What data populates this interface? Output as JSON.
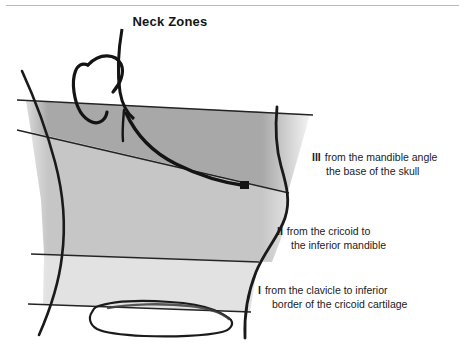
{
  "figure": {
    "title": "Neck Zones",
    "width": 465,
    "height": 357,
    "background": "#ffffff",
    "top_rule_color": "#b9b9b9"
  },
  "zones": [
    {
      "id": "zone-3",
      "numeral": "III",
      "line1": "from the mandible angle",
      "line2": "the base of the skull",
      "fill": "#a8a8a8",
      "description": "Superior zone between the angle of the mandible and the base of the skull"
    },
    {
      "id": "zone-2",
      "numeral": "II",
      "line1": "from the cricoid to",
      "line2": "the inferior mandible",
      "fill": "#c6c6c6",
      "description": "Middle zone between the cricoid cartilage and the inferior border of the mandible"
    },
    {
      "id": "zone-1",
      "numeral": "I",
      "line1": "from the clavicle to inferior",
      "line2": "border of the cricoid cartilage",
      "fill": "#e2e2e2",
      "description": "Inferior zone between the clavicle and the inferior border of the cricoid cartilage"
    }
  ],
  "anatomy": {
    "stroke_color": "#1a1a1a",
    "divider_color": "#232323",
    "parts": [
      {
        "name": "ear",
        "label": "ear outline"
      },
      {
        "name": "mandible",
        "label": "mandible / jaw line"
      },
      {
        "name": "posterior-neck",
        "label": "posterior neck border"
      },
      {
        "name": "anterior-neck",
        "label": "anterior neck border"
      },
      {
        "name": "clavicle",
        "label": "clavicle outline"
      }
    ],
    "dividers": [
      {
        "name": "skull-base-line",
        "label": "base of the skull"
      },
      {
        "name": "mandible-angle-line",
        "label": "angle of the mandible"
      },
      {
        "name": "cricoid-line",
        "label": "inferior border of the cricoid cartilage"
      },
      {
        "name": "clavicle-line",
        "label": "clavicle"
      }
    ]
  }
}
